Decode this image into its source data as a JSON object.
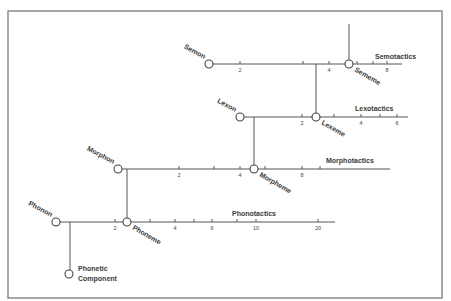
{
  "diagram": {
    "frame": {
      "x": 8,
      "y": 11,
      "width": 434,
      "height": 287,
      "color": "#8a8a8a"
    },
    "tactics": [
      {
        "id": "semotactics",
        "label": "Semotactics",
        "y": 64,
        "x_start": 209,
        "x_end": 402,
        "label_x": 375,
        "label_y": 59,
        "start_node": {
          "label": "Semon",
          "x": 209
        },
        "ticks": [
          {
            "x": 240,
            "label": "2"
          },
          {
            "x": 303,
            "label": ""
          },
          {
            "x": 329,
            "label": "4"
          },
          {
            "x": 357,
            "label": ""
          },
          {
            "x": 373,
            "label": ""
          },
          {
            "x": 387,
            "label": "8"
          }
        ],
        "emic_node": {
          "label": "Sememe",
          "x": 349
        }
      },
      {
        "id": "lexotactics",
        "label": "Lexotactics",
        "y": 117,
        "x_start": 240,
        "x_end": 408,
        "label_x": 355,
        "label_y": 111,
        "start_node": {
          "label": "Lexon",
          "x": 240
        },
        "ticks": [
          {
            "x": 302,
            "label": "2"
          },
          {
            "x": 334,
            "label": ""
          },
          {
            "x": 361,
            "label": "4"
          },
          {
            "x": 380,
            "label": ""
          },
          {
            "x": 397,
            "label": "6"
          }
        ],
        "emic_node": {
          "label": "Lexeme",
          "x": 316
        }
      },
      {
        "id": "morphotactics",
        "label": "Morphotactics",
        "y": 169,
        "x_start": 118,
        "x_end": 390,
        "label_x": 326,
        "label_y": 163,
        "start_node": {
          "label": "Morphon",
          "x": 118
        },
        "ticks": [
          {
            "x": 179,
            "label": "2"
          },
          {
            "x": 214,
            "label": ""
          },
          {
            "x": 240,
            "label": "4"
          },
          {
            "x": 265,
            "label": ""
          },
          {
            "x": 302,
            "label": "8"
          },
          {
            "x": 320,
            "label": ""
          }
        ],
        "emic_node": {
          "label": "Morpheme",
          "x": 254
        }
      },
      {
        "id": "phonotactics",
        "label": "Phonotactics",
        "y": 222,
        "x_start": 56,
        "x_end": 335,
        "label_x": 232,
        "label_y": 216,
        "start_node": {
          "label": "Phonon",
          "x": 56
        },
        "ticks": [
          {
            "x": 115,
            "label": "2"
          },
          {
            "x": 150,
            "label": ""
          },
          {
            "x": 175,
            "label": "4"
          },
          {
            "x": 194,
            "label": ""
          },
          {
            "x": 212,
            "label": "6"
          },
          {
            "x": 237,
            "label": ""
          },
          {
            "x": 256,
            "label": "10"
          },
          {
            "x": 318,
            "label": "20"
          }
        ],
        "emic_node": {
          "label": "Phoneme",
          "x": 127
        }
      }
    ],
    "connectors": [
      {
        "from": "sememe-top",
        "x": 349,
        "y1": 24,
        "y2": 64
      },
      {
        "from": "semotactics-to-lexeme",
        "x": 316,
        "y1": 64,
        "y2": 117
      },
      {
        "from": "lexotactics-to-morpheme",
        "x": 254,
        "y1": 117,
        "y2": 169
      },
      {
        "from": "morphotactics-to-phoneme",
        "x": 127,
        "y1": 169,
        "y2": 222
      },
      {
        "from": "phonotactics-to-phonetic",
        "x": 70,
        "y1": 222,
        "y2": 274
      }
    ],
    "phonetic_component": {
      "label_line1": "Phonetic",
      "label_line2": "Component",
      "x": 69,
      "y": 274
    }
  }
}
